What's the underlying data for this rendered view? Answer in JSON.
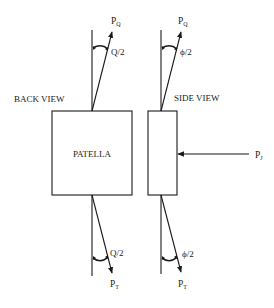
{
  "figure": {
    "views": {
      "back": {
        "title": "BACK VIEW",
        "body_label": "PATELLA",
        "top_force": {
          "symbol": "P",
          "subscript": "Q"
        },
        "top_angle": "Q/2",
        "bottom_force": {
          "symbol": "P",
          "subscript": "T"
        },
        "bottom_angle": "Q/2"
      },
      "side": {
        "title": "SIDE VIEW",
        "top_force": {
          "symbol": "P",
          "subscript": "Q"
        },
        "top_angle": "ϕ/2",
        "bottom_force": {
          "symbol": "P",
          "subscript": "T"
        },
        "bottom_angle": "ϕ/2",
        "joint_force": {
          "symbol": "P",
          "subscript": "J"
        }
      }
    },
    "colors": {
      "line": "#1a1a1a",
      "background": "#ffffff",
      "text": "#222222"
    }
  }
}
